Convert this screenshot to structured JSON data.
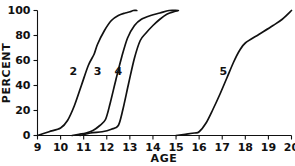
{
  "chart_data": {
    "type": "line",
    "title": "",
    "xlabel": "AGE",
    "ylabel": "PERCENT",
    "xlim": [
      9,
      20
    ],
    "ylim": [
      0,
      100
    ],
    "xticks": [
      9,
      10,
      11,
      12,
      13,
      14,
      15,
      16,
      17,
      18,
      19,
      20
    ],
    "xtick_labels": [
      "9",
      "10",
      "11",
      "12",
      "13",
      "14",
      "15",
      "16",
      "17",
      "18",
      "19",
      "20"
    ],
    "yticks": [
      0,
      20,
      40,
      60,
      80,
      100
    ],
    "ytick_labels": [
      "0",
      "20",
      "40",
      "60",
      "80",
      "100"
    ],
    "grid": false,
    "legend": "inline-curve-labels",
    "series": [
      {
        "name": "2",
        "label": "2",
        "label_x": 10.55,
        "label_y": 52,
        "x": [
          9.0,
          9.5,
          10.0,
          10.3,
          10.6,
          10.9,
          11.2,
          11.45,
          11.6,
          11.9,
          12.2,
          12.5,
          12.8,
          13.0,
          13.15,
          13.3
        ],
        "y": [
          0,
          3,
          6,
          12,
          24,
          40,
          56,
          65,
          73,
          84,
          92,
          96,
          98,
          99,
          100,
          100
        ]
      },
      {
        "name": "3",
        "label": "3",
        "label_x": 11.6,
        "label_y": 52,
        "x": [
          10.5,
          10.8,
          11.1,
          11.4,
          11.7,
          11.95,
          12.15,
          12.4,
          12.65,
          12.9,
          13.2,
          13.5,
          13.9,
          14.3,
          14.7,
          15.05
        ],
        "y": [
          0,
          1,
          2,
          4,
          8,
          13,
          26,
          45,
          63,
          78,
          88,
          93,
          96,
          98,
          100,
          100
        ]
      },
      {
        "name": "4",
        "label": "4",
        "label_x": 12.5,
        "label_y": 52,
        "x": [
          10.85,
          11.3,
          11.8,
          12.2,
          12.5,
          12.7,
          12.95,
          13.2,
          13.45,
          13.7,
          14.0,
          14.3,
          14.6,
          14.9,
          15.1
        ],
        "y": [
          0,
          2,
          3,
          5,
          8,
          21,
          42,
          62,
          76,
          82,
          88,
          93,
          97,
          99,
          100
        ]
      },
      {
        "name": "5",
        "label": "5",
        "label_x": 17.05,
        "label_y": 52,
        "x": [
          15.0,
          15.4,
          15.8,
          16.0,
          16.3,
          16.6,
          16.9,
          17.2,
          17.5,
          17.75,
          18.0,
          18.6,
          19.2,
          19.6,
          20.0
        ],
        "y": [
          0,
          1,
          2,
          3,
          10,
          21,
          33,
          46,
          59,
          68,
          74,
          81,
          88,
          93,
          100
        ]
      }
    ]
  }
}
